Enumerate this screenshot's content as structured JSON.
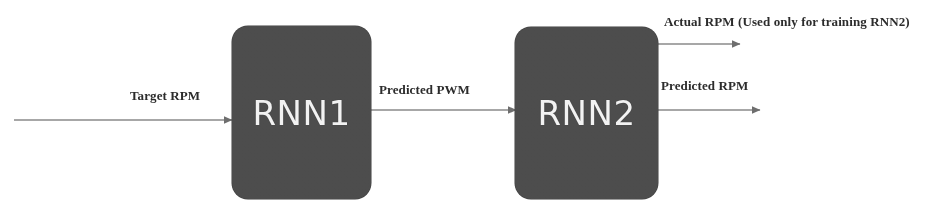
{
  "diagram": {
    "background_color": "#ffffff",
    "node_fill_color": "#4d4d4d",
    "node_text_color": "#f2f2f2",
    "edge_color": "#6e6e6e",
    "label_color": "#2c2c2c",
    "nodes": [
      {
        "id": "rnn1",
        "label": "RNN1",
        "x": 232,
        "y": 26,
        "width": 139,
        "height": 173
      },
      {
        "id": "rnn2",
        "label": "RNN2",
        "x": 515,
        "y": 27,
        "width": 143,
        "height": 172
      }
    ],
    "edges": [
      {
        "id": "target-rpm",
        "label": "Target RPM",
        "from": "input",
        "to": "rnn1",
        "x1": 14,
        "y1": 120,
        "x2": 232,
        "y2": 120
      },
      {
        "id": "predicted-pwm",
        "label": "Predicted PWM",
        "from": "rnn1",
        "to": "rnn2",
        "x1": 371,
        "y1": 110,
        "x2": 515,
        "y2": 110
      },
      {
        "id": "actual-rpm",
        "label": "Actual RPM (Used only for training RNN2)",
        "from": "rnn2",
        "to": "output",
        "x1": 658,
        "y1": 44,
        "x2": 740,
        "y2": 44
      },
      {
        "id": "predicted-rpm",
        "label": "Predicted RPM",
        "from": "rnn2",
        "to": "output",
        "x1": 658,
        "y1": 110,
        "x2": 760,
        "y2": 110
      }
    ]
  }
}
